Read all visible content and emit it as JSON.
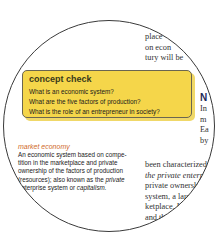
{
  "top_text": {
    "lines": [
      "place",
      "on econ",
      "tury will be"
    ]
  },
  "concept_check": {
    "title": "concept check",
    "questions": [
      "What is an economic system?",
      "What are the five factors of production?",
      "What is the role of an entrepreneur in society?"
    ],
    "background_color": "#f5d64a"
  },
  "right_edge": {
    "heading_fragment": "N",
    "lines": [
      "In",
      "m",
      "Ea",
      "by"
    ]
  },
  "glossary": {
    "term": "market economy",
    "term_color": "#d06a2a",
    "definition_lines": [
      "An economic system based on compe-",
      "tition in the marketplace and private",
      "ownership of the factors of production",
      "(resources); also known as the ",
      "enterprise system or "
    ],
    "italic_1": "private",
    "italic_2": "capitalism."
  },
  "right_text": {
    "line1": "been characterized",
    "line2_italic": "the private enterpri",
    "line3": "private ownersh",
    "line4": "system, a large",
    "line5": "ketplace. In a",
    "line6": "and the go",
    "line7": "A p",
    "line8": "the"
  }
}
